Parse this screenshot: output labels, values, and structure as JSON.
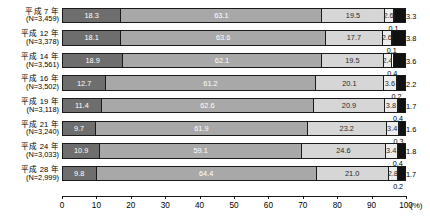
{
  "chart_data": {
    "type": "bar",
    "orientation": "horizontal",
    "stacked": true,
    "stack_total": 100,
    "title": "",
    "xlabel": "(%)",
    "ylabel": "",
    "xlim": [
      0,
      100
    ],
    "xticks": [
      0,
      10,
      20,
      30,
      40,
      50,
      60,
      70,
      80,
      90,
      100
    ],
    "xtick_labels": [
      "0",
      "10",
      "20",
      "30",
      "40",
      "50",
      "60",
      "70",
      "80",
      "90",
      "100"
    ],
    "unit_label": "(%)",
    "grid": false,
    "legend": "none",
    "categories": [
      "平成 7 年",
      "平成 12 年",
      "平成 14 年",
      "平成 16 年",
      "平成 19 年",
      "平成 21 年",
      "平成 24 年",
      "平成 28 年"
    ],
    "category_sublabels": [
      "(N=3,459)",
      "(N=3,378)",
      "(N=3,561)",
      "(N=3,502)",
      "(N=3,118)",
      "(N=3,240)",
      "(N=3,033)",
      "(N=2,999)"
    ],
    "series": [
      {
        "name": "segment-1",
        "color": "#6e6e6e",
        "values": [
          18.3,
          18.1,
          18.9,
          12.7,
          11.4,
          9.7,
          10.9,
          9.8
        ]
      },
      {
        "name": "segment-2",
        "color": "#a8a8a8",
        "values": [
          63.1,
          63.6,
          62.1,
          61.2,
          62.6,
          61.9,
          59.1,
          64.4
        ]
      },
      {
        "name": "segment-3",
        "color": "#d6d6d6",
        "values": [
          19.5,
          17.7,
          19.5,
          20.1,
          20.9,
          23.2,
          24.6,
          21.0
        ]
      },
      {
        "name": "segment-4",
        "color": "#ededed",
        "values": [
          2.6,
          2.6,
          2.4,
          3.6,
          3.8,
          3.4,
          3.4,
          2.8
        ]
      },
      {
        "name": "segment-5",
        "color": "#ffffff",
        "values": [
          0.1,
          0.1,
          0.4,
          0.2,
          0.4,
          0.3,
          0.4,
          0.2
        ]
      },
      {
        "name": "segment-6",
        "color": "#111111",
        "values": [
          3.3,
          3.8,
          3.6,
          2.2,
          1.7,
          1.6,
          1.8,
          1.7
        ]
      }
    ],
    "rows": [
      {
        "year": "平成 7 年",
        "n": "(N=3,459)",
        "values": [
          18.3,
          63.1,
          19.5,
          2.6,
          0.1,
          3.3
        ]
      },
      {
        "year": "平成 12 年",
        "n": "(N=3,378)",
        "values": [
          18.1,
          63.6,
          17.7,
          2.6,
          0.1,
          3.8
        ]
      },
      {
        "year": "平成 14 年",
        "n": "(N=3,561)",
        "values": [
          18.9,
          62.1,
          19.5,
          2.4,
          0.4,
          3.6
        ]
      },
      {
        "year": "平成 16 年",
        "n": "(N=3,502)",
        "values": [
          12.7,
          61.2,
          20.1,
          3.6,
          0.2,
          2.2
        ]
      },
      {
        "year": "平成 19 年",
        "n": "(N=3,118)",
        "values": [
          11.4,
          62.6,
          20.9,
          3.8,
          0.4,
          1.7
        ]
      },
      {
        "year": "平成 21 年",
        "n": "(N=3,240)",
        "values": [
          9.7,
          61.9,
          23.2,
          3.4,
          0.3,
          1.6
        ]
      },
      {
        "year": "平成 24 年",
        "n": "(N=3,033)",
        "values": [
          10.9,
          59.1,
          24.6,
          3.4,
          0.4,
          1.8
        ]
      },
      {
        "year": "平成 28 年",
        "n": "(N=2,999)",
        "values": [
          9.8,
          64.4,
          21.0,
          2.8,
          0.2,
          1.7
        ]
      }
    ]
  }
}
